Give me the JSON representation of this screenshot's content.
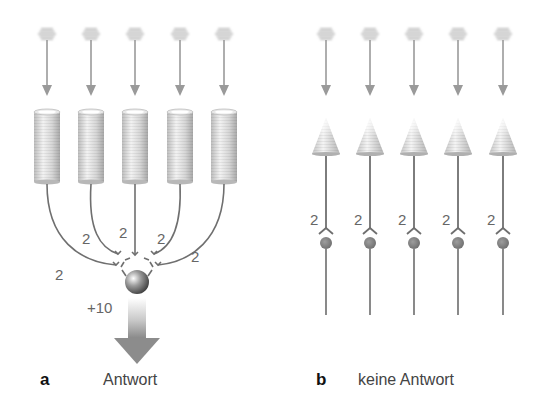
{
  "panels": [
    {
      "letter": "a",
      "caption": "Antwort",
      "receptor_type": "cylinder",
      "receptor_count": 5,
      "synapse_weights": [
        "2",
        "2",
        "2",
        "2",
        "2"
      ],
      "sum_label": "+10",
      "output": "response-arrow"
    },
    {
      "letter": "b",
      "caption": "keine Antwort",
      "receptor_type": "cone",
      "receptor_count": 5,
      "synapse_weights": [
        "2",
        "2",
        "2",
        "2",
        "2"
      ],
      "output": "none"
    }
  ],
  "colors": {
    "line": "#6f6f6f",
    "stimulus_arrow": "#9a9a9a",
    "soma": "#7a7a7a",
    "output_arrow": "#8c8c8c"
  }
}
